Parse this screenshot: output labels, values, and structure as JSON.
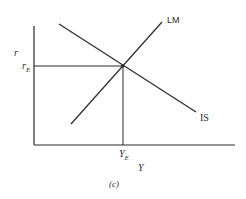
{
  "diagram": {
    "type": "IS-LM model",
    "caption": "(c)",
    "axes": {
      "y_label": "r",
      "x_label": "Y"
    },
    "curves": [
      {
        "name": "LM",
        "label": "LM",
        "slope": "upward"
      },
      {
        "name": "IS",
        "label": "IS",
        "slope": "downward"
      }
    ],
    "equilibrium": {
      "r_label": "r",
      "r_sub": "E",
      "y_label": "Y",
      "y_sub": "E"
    },
    "colors": {
      "line": "#2a2a2a",
      "background": "#ffffff"
    }
  }
}
